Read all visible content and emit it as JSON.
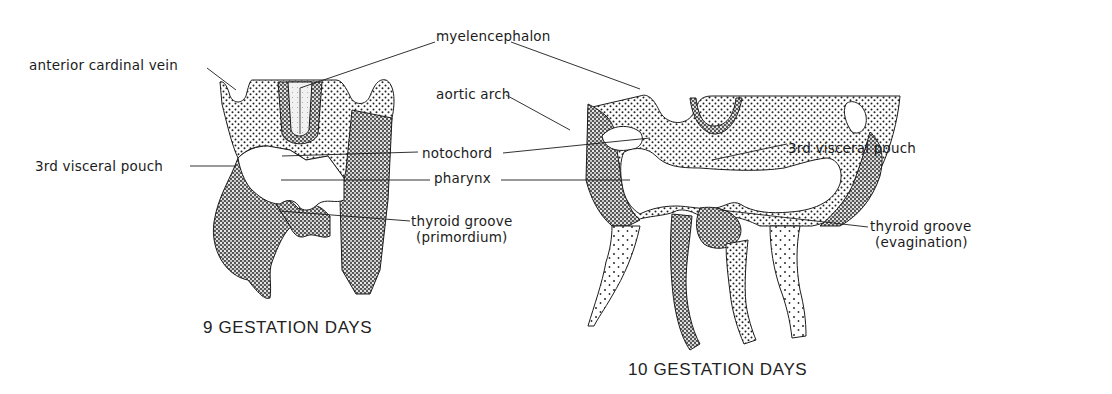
{
  "figure": {
    "panels": [
      {
        "id": "day9",
        "caption": "9 GESTATION DAYS",
        "caption_pos": [
          203,
          328
        ],
        "labels": [
          {
            "id": "anterior-cardinal-vein",
            "text": "anterior cardinal vein",
            "pos": [
              29,
              57
            ],
            "line": [
              [
                207,
                68
              ],
              [
                236,
                90
              ]
            ]
          },
          {
            "id": "myelencephalon",
            "text": "myelencephalon",
            "pos": [
              436,
              28
            ],
            "line": [
              [
                435,
                42
              ],
              [
                300,
                88
              ]
            ]
          },
          {
            "id": "3rd-visceral-pouch",
            "text": "3rd visceral pouch",
            "pos": [
              35,
              158
            ],
            "line": [
              [
                190,
                166
              ],
              [
                236,
                166
              ]
            ]
          },
          {
            "id": "notochord",
            "text": "notochord",
            "pos": [
              422,
              145
            ],
            "line": [
              [
                418,
                152
              ],
              [
                282,
                156
              ]
            ]
          },
          {
            "id": "pharynx",
            "text": "pharynx",
            "pos": [
              434,
              170
            ],
            "line": [
              [
                430,
                180
              ],
              [
                281,
                180
              ]
            ]
          },
          {
            "id": "thyroid-groove-primordium",
            "text": "thyroid groove",
            "text2": "(primordium)",
            "pos": [
              411,
              213
            ],
            "line": [
              [
                410,
                221
              ],
              [
                280,
                211
              ]
            ]
          }
        ]
      },
      {
        "id": "day10",
        "caption": "10 GESTATION DAYS",
        "caption_pos": [
          628,
          369
        ],
        "labels": [
          {
            "id": "aortic-arch",
            "text": "aortic arch",
            "pos": [
              436,
              86
            ],
            "line": [
              [
                506,
                95
              ],
              [
                570,
                130
              ]
            ]
          },
          {
            "id": "notochord",
            "text": "notochord",
            "pos": [
              437,
              145
            ],
            "line": [
              [
                503,
                153
              ],
              [
                650,
                138
              ]
            ]
          },
          {
            "id": "pharynx",
            "text": "pharynx",
            "pos": [
              448,
              170
            ],
            "line": [
              [
                501,
                180
              ],
              [
                630,
                180
              ]
            ]
          },
          {
            "id": "myelencephalon",
            "text": "myelencephalon",
            "pos": [
              436,
              28
            ],
            "line": [
              [
                511,
                42
              ],
              [
                640,
                89
              ]
            ]
          },
          {
            "id": "3rd-visceral-pouch",
            "text": "3rd visceral pouch",
            "pos": [
              788,
              140
            ],
            "line": [
              [
                787,
                144
              ],
              [
                712,
                160
              ]
            ]
          },
          {
            "id": "thyroid-groove-evagination",
            "text": "thyroid groove",
            "text2": "(evagination)",
            "pos": [
              870,
              218
            ],
            "line": [
              [
                868,
                227
              ],
              [
                720,
                210
              ]
            ]
          }
        ]
      }
    ],
    "colors": {
      "ink": "#1c1c1c",
      "stipple": "#2a2a2a",
      "background": "#ffffff"
    }
  }
}
